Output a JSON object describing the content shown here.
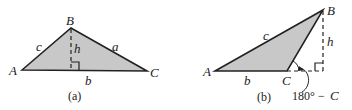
{
  "figure_a": {
    "caption": "(a)",
    "vertices": {
      "A": "A",
      "B": "B",
      "C": "C"
    },
    "sides": {
      "a": "a",
      "b": "b",
      "c": "c"
    },
    "height": "h"
  },
  "figure_b": {
    "caption": "(b)",
    "vertices": {
      "A": "A",
      "B": "B",
      "C": "C"
    },
    "sides": {
      "b": "b",
      "c": "c"
    },
    "height": "h",
    "angle_label_num": "180°",
    "angle_label_minus": "−",
    "angle_label_var": "C"
  },
  "colors": {
    "fill": "#c8c8c8",
    "stroke": "#222222"
  }
}
